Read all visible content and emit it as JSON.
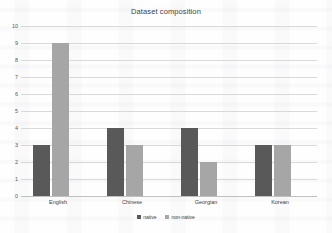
{
  "chart_data": {
    "type": "bar",
    "title": "Dataset composition",
    "xlabel": "",
    "ylabel": "",
    "categories": [
      "English",
      "Chinese",
      "Georgian",
      "Korean"
    ],
    "series": [
      {
        "name": "native",
        "color": "#595959",
        "values": [
          3,
          4,
          4,
          3
        ]
      },
      {
        "name": "non-native",
        "color": "#a6a6a6",
        "values": [
          9,
          3,
          2,
          3
        ]
      }
    ],
    "ylim": [
      0,
      10
    ],
    "yticks": [
      0,
      1,
      2,
      3,
      4,
      5,
      6,
      7,
      8,
      9,
      10
    ],
    "ytick_labels": [
      "0",
      "1",
      "2",
      "3",
      "4",
      "5",
      "6",
      "7",
      "8",
      "9",
      "10"
    ],
    "grid": true,
    "legend_position": "bottom"
  }
}
